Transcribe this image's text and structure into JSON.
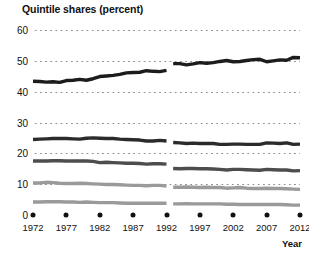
{
  "chart_data": {
    "type": "line",
    "title": "Quintile shares (percent)",
    "xlabel": "Year",
    "ylabel": "",
    "ylim": [
      0,
      60
    ],
    "xlim": [
      1972,
      2012
    ],
    "grid": true,
    "legend": "none",
    "yticks": [
      0,
      10,
      20,
      30,
      40,
      50,
      60
    ],
    "xticks": [
      1972,
      1977,
      1982,
      1987,
      1992,
      1997,
      2002,
      2007,
      2012
    ],
    "ytick_labels": [
      "0",
      "10",
      "20",
      "30",
      "40",
      "50",
      "60"
    ],
    "xtick_labels": [
      "1972",
      "1977",
      "1982",
      "1987",
      "1992",
      "1997",
      "2002",
      "2007",
      "2012"
    ],
    "note": "series are broken between 1992 and 1993",
    "break_between": [
      1992,
      1993
    ],
    "x": [
      1972,
      1973,
      1974,
      1975,
      1976,
      1977,
      1978,
      1979,
      1980,
      1981,
      1982,
      1983,
      1984,
      1985,
      1986,
      1987,
      1988,
      1989,
      1990,
      1991,
      1992,
      1993,
      1994,
      1995,
      1996,
      1997,
      1998,
      1999,
      2000,
      2001,
      2002,
      2003,
      2004,
      2005,
      2006,
      2007,
      2008,
      2009,
      2010,
      2011,
      2012
    ],
    "series": [
      {
        "name": "Highest quintile",
        "color": "#1c1c1c",
        "values": [
          43.4,
          43.3,
          43.1,
          43.2,
          43.0,
          43.6,
          43.7,
          44.0,
          43.7,
          44.2,
          44.9,
          45.1,
          45.3,
          45.6,
          46.1,
          46.2,
          46.3,
          46.8,
          46.6,
          46.5,
          46.9,
          49.1,
          49.1,
          48.7,
          49.0,
          49.4,
          49.2,
          49.4,
          49.8,
          50.1,
          49.7,
          49.8,
          50.1,
          50.4,
          50.5,
          49.7,
          50.0,
          50.3,
          50.2,
          51.1,
          51.0
        ]
      },
      {
        "name": "Fourth quintile",
        "color": "#2b2b2b",
        "values": [
          24.5,
          24.6,
          24.7,
          24.8,
          24.8,
          24.8,
          24.7,
          24.6,
          24.9,
          25.0,
          24.9,
          24.8,
          24.8,
          24.6,
          24.5,
          24.4,
          24.3,
          24.0,
          24.0,
          24.2,
          24.0,
          23.5,
          23.4,
          23.2,
          23.3,
          23.2,
          23.2,
          23.2,
          22.9,
          22.9,
          23.0,
          23.0,
          22.9,
          22.9,
          22.9,
          23.4,
          23.3,
          23.2,
          23.4,
          22.9,
          23.0
        ]
      },
      {
        "name": "Third quintile",
        "color": "#4d4d4d",
        "values": [
          17.5,
          17.5,
          17.5,
          17.6,
          17.6,
          17.5,
          17.5,
          17.5,
          17.5,
          17.4,
          17.0,
          17.1,
          17.0,
          16.9,
          16.8,
          16.8,
          16.7,
          16.5,
          16.6,
          16.6,
          16.5,
          15.1,
          15.0,
          15.1,
          15.1,
          15.0,
          15.0,
          14.9,
          14.8,
          14.6,
          14.8,
          14.8,
          14.7,
          14.6,
          14.5,
          14.8,
          14.7,
          14.6,
          14.6,
          14.3,
          14.4
        ]
      },
      {
        "name": "Second quintile",
        "color": "#9a9a9a",
        "values": [
          10.4,
          10.4,
          10.6,
          10.5,
          10.3,
          10.2,
          10.2,
          10.3,
          10.2,
          10.1,
          10.0,
          9.9,
          9.9,
          9.8,
          9.7,
          9.6,
          9.6,
          9.5,
          9.6,
          9.6,
          9.4,
          9.0,
          9.0,
          9.1,
          9.0,
          8.9,
          9.0,
          8.9,
          8.9,
          8.7,
          8.8,
          8.9,
          8.7,
          8.6,
          8.6,
          8.7,
          8.6,
          8.6,
          8.5,
          8.4,
          8.3
        ]
      },
      {
        "name": "Lowest quintile",
        "color": "#9a9a9a",
        "values": [
          4.2,
          4.2,
          4.3,
          4.3,
          4.3,
          4.2,
          4.2,
          4.1,
          4.2,
          4.1,
          4.0,
          4.0,
          4.0,
          3.9,
          3.8,
          3.8,
          3.8,
          3.8,
          3.8,
          3.8,
          3.8,
          3.6,
          3.6,
          3.7,
          3.6,
          3.6,
          3.6,
          3.6,
          3.6,
          3.5,
          3.5,
          3.4,
          3.4,
          3.4,
          3.4,
          3.4,
          3.4,
          3.4,
          3.3,
          3.2,
          3.2
        ]
      }
    ]
  }
}
